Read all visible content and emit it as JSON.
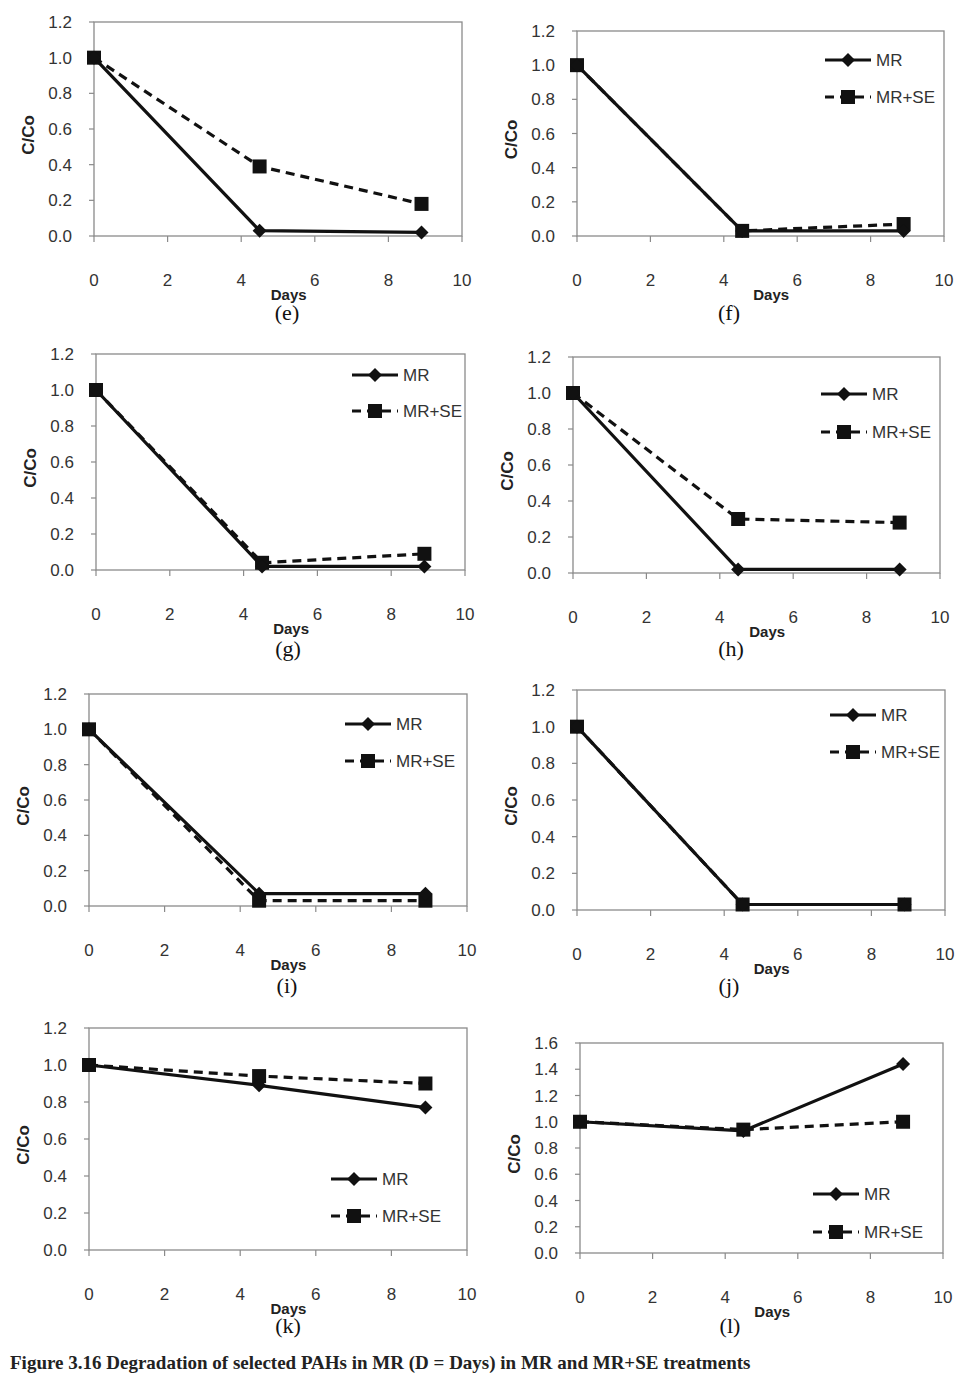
{
  "figure": {
    "caption": "Figure 3.16 Degradation of selected PAHs in MR (D = Days) in MR and MR+SE treatments",
    "caption_clipped": true
  },
  "style": {
    "line_color": "#111111",
    "axis_color": "#8a8a8a",
    "tick_label_color": "#333333"
  },
  "chart_data": [
    {
      "id": "e",
      "panel_label": "(e)",
      "type": "line",
      "title": "",
      "xlabel": "Days",
      "ylabel": "C/Co",
      "xlim": [
        0,
        10
      ],
      "ylim": [
        0,
        1.2
      ],
      "xticks": [
        0,
        2,
        4,
        6,
        8,
        10
      ],
      "yticks": [
        "0.0",
        "0.2",
        "0.4",
        "0.6",
        "0.8",
        "1.0",
        "1.2"
      ],
      "grid": false,
      "legend": null,
      "x": [
        0,
        4.5,
        8.9
      ],
      "series": [
        {
          "name": "MR",
          "style": "solid",
          "marker": "diamond",
          "values": [
            1.0,
            0.03,
            0.02
          ]
        },
        {
          "name": "MR+SE",
          "style": "dashed",
          "marker": "square",
          "values": [
            1.0,
            0.39,
            0.18
          ]
        }
      ],
      "box": {
        "left": 94,
        "right": 462,
        "top": 22,
        "bottom": 236
      },
      "label_pos": {
        "x": 287,
        "y": 312
      }
    },
    {
      "id": "f",
      "panel_label": "(f)",
      "type": "line",
      "title": "",
      "xlabel": "Days",
      "ylabel": "C/Co",
      "xlim": [
        0,
        10
      ],
      "ylim": [
        0,
        1.2
      ],
      "xticks": [
        0,
        2,
        4,
        6,
        8,
        10
      ],
      "yticks": [
        "0.0",
        "0.2",
        "0.4",
        "0.6",
        "0.8",
        "1.0",
        "1.2"
      ],
      "grid": false,
      "legend": {
        "position": "top-right",
        "entries": [
          "MR",
          "MR+SE"
        ]
      },
      "x": [
        0,
        4.5,
        8.9
      ],
      "series": [
        {
          "name": "MR",
          "style": "solid",
          "marker": "diamond",
          "values": [
            1.0,
            0.03,
            0.03
          ]
        },
        {
          "name": "MR+SE",
          "style": "dashed",
          "marker": "square",
          "values": [
            1.0,
            0.03,
            0.07
          ]
        }
      ],
      "box": {
        "left": 577,
        "right": 944,
        "top": 31,
        "bottom": 236
      },
      "legend_box": {
        "x": 825,
        "y1": 60,
        "y2": 97
      },
      "label_pos": {
        "x": 729,
        "y": 312
      }
    },
    {
      "id": "g",
      "panel_label": "(g)",
      "type": "line",
      "title": "",
      "xlabel": "Days",
      "ylabel": "C/Co",
      "xlim": [
        0,
        10
      ],
      "ylim": [
        0,
        1.2
      ],
      "xticks": [
        0,
        2,
        4,
        6,
        8,
        10
      ],
      "yticks": [
        "0.0",
        "0.2",
        "0.4",
        "0.6",
        "0.8",
        "1.0",
        "1.2"
      ],
      "grid": false,
      "legend": {
        "position": "top-right",
        "entries": [
          "MR",
          "MR+SE"
        ]
      },
      "x": [
        0,
        4.5,
        8.9
      ],
      "series": [
        {
          "name": "MR",
          "style": "solid",
          "marker": "diamond",
          "values": [
            1.0,
            0.02,
            0.02
          ]
        },
        {
          "name": "MR+SE",
          "style": "dashed",
          "marker": "square",
          "values": [
            1.0,
            0.04,
            0.09
          ]
        }
      ],
      "box": {
        "left": 96,
        "right": 465,
        "top": 354,
        "bottom": 570
      },
      "legend_box": {
        "x": 352,
        "y1": 375,
        "y2": 411
      },
      "label_pos": {
        "x": 288,
        "y": 648
      }
    },
    {
      "id": "h",
      "panel_label": "(h)",
      "type": "line",
      "title": "",
      "xlabel": "Days",
      "ylabel": "C/Co",
      "xlim": [
        0,
        10
      ],
      "ylim": [
        0,
        1.2
      ],
      "xticks": [
        0,
        2,
        4,
        6,
        8,
        10
      ],
      "yticks": [
        "0.0",
        "0.2",
        "0.4",
        "0.6",
        "0.8",
        "1.0",
        "1.2"
      ],
      "grid": false,
      "legend": {
        "position": "top-right",
        "entries": [
          "MR",
          "MR+SE"
        ]
      },
      "x": [
        0,
        4.5,
        8.9
      ],
      "series": [
        {
          "name": "MR",
          "style": "solid",
          "marker": "diamond",
          "values": [
            1.0,
            0.02,
            0.02
          ]
        },
        {
          "name": "MR+SE",
          "style": "dashed",
          "marker": "square",
          "values": [
            1.0,
            0.3,
            0.28
          ]
        }
      ],
      "box": {
        "left": 573,
        "right": 940,
        "top": 357,
        "bottom": 573
      },
      "legend_box": {
        "x": 821,
        "y1": 394,
        "y2": 432
      },
      "label_pos": {
        "x": 731,
        "y": 648
      }
    },
    {
      "id": "i",
      "panel_label": "(i)",
      "type": "line",
      "title": "",
      "xlabel": "Days",
      "ylabel": "C/Co",
      "xlim": [
        0,
        10
      ],
      "ylim": [
        0,
        1.2
      ],
      "xticks": [
        0,
        2,
        4,
        6,
        8,
        10
      ],
      "yticks": [
        "0.0",
        "0.2",
        "0.4",
        "0.6",
        "0.8",
        "1.0",
        "1.2"
      ],
      "grid": false,
      "legend": {
        "position": "top-right",
        "entries": [
          "MR",
          "MR+SE"
        ]
      },
      "x": [
        0,
        4.5,
        8.9
      ],
      "series": [
        {
          "name": "MR",
          "style": "solid",
          "marker": "diamond",
          "values": [
            1.0,
            0.07,
            0.07
          ]
        },
        {
          "name": "MR+SE",
          "style": "dashed",
          "marker": "square",
          "values": [
            1.0,
            0.03,
            0.03
          ]
        }
      ],
      "box": {
        "left": 89,
        "right": 467,
        "top": 694,
        "bottom": 906
      },
      "legend_box": {
        "x": 345,
        "y1": 724,
        "y2": 761
      },
      "label_pos": {
        "x": 287,
        "y": 985
      }
    },
    {
      "id": "j",
      "panel_label": "(j)",
      "type": "line",
      "title": "",
      "xlabel": "Days",
      "ylabel": "C/Co",
      "xlim": [
        0,
        10
      ],
      "ylim": [
        0,
        1.2
      ],
      "xticks": [
        0,
        2,
        4,
        6,
        8,
        10
      ],
      "yticks": [
        "0.0",
        "0.2",
        "0.4",
        "0.6",
        "0.8",
        "1.0",
        "1.2"
      ],
      "grid": false,
      "legend": {
        "position": "top-right",
        "entries": [
          "MR",
          "MR+SE"
        ]
      },
      "x": [
        0,
        4.5,
        8.9
      ],
      "series": [
        {
          "name": "MR",
          "style": "solid",
          "marker": "diamond",
          "values": [
            1.0,
            0.03,
            0.03
          ]
        },
        {
          "name": "MR+SE",
          "style": "dashed",
          "marker": "square",
          "values": [
            1.0,
            0.03,
            0.03
          ]
        }
      ],
      "box": {
        "left": 577,
        "right": 945,
        "top": 690,
        "bottom": 910
      },
      "legend_box": {
        "x": 830,
        "y1": 715,
        "y2": 752
      },
      "label_pos": {
        "x": 729,
        "y": 985
      }
    },
    {
      "id": "k",
      "panel_label": "(k)",
      "type": "line",
      "title": "",
      "xlabel": "Days",
      "ylabel": "C/Co",
      "xlim": [
        0,
        10
      ],
      "ylim": [
        0,
        1.2
      ],
      "xticks": [
        0,
        2,
        4,
        6,
        8,
        10
      ],
      "yticks": [
        "0.0",
        "0.2",
        "0.4",
        "0.6",
        "0.8",
        "1.0",
        "1.2"
      ],
      "grid": false,
      "legend": {
        "position": "bottom-right",
        "entries": [
          "MR",
          "MR+SE"
        ]
      },
      "x": [
        0,
        4.5,
        8.9
      ],
      "series": [
        {
          "name": "MR",
          "style": "solid",
          "marker": "diamond",
          "values": [
            1.0,
            0.89,
            0.77
          ]
        },
        {
          "name": "MR+SE",
          "style": "dashed",
          "marker": "square",
          "values": [
            1.0,
            0.94,
            0.9
          ]
        }
      ],
      "box": {
        "left": 89,
        "right": 467,
        "top": 1028,
        "bottom": 1250
      },
      "legend_box": {
        "x": 331,
        "y1": 1179,
        "y2": 1216
      },
      "label_pos": {
        "x": 288,
        "y": 1325
      }
    },
    {
      "id": "l",
      "panel_label": "(l)",
      "type": "line",
      "title": "",
      "xlabel": "Days",
      "ylabel": "C/Co",
      "xlim": [
        0,
        10
      ],
      "ylim": [
        0,
        1.6
      ],
      "xticks": [
        0,
        2,
        4,
        6,
        8,
        10
      ],
      "yticks": [
        "0.0",
        "0.2",
        "0.4",
        "0.6",
        "0.8",
        "1.0",
        "1.2",
        "1.4",
        "1.6"
      ],
      "grid": false,
      "legend": {
        "position": "bottom-right",
        "entries": [
          "MR",
          "MR+SE"
        ]
      },
      "x": [
        0,
        4.5,
        8.9
      ],
      "series": [
        {
          "name": "MR",
          "style": "solid",
          "marker": "diamond",
          "values": [
            1.0,
            0.93,
            1.44
          ]
        },
        {
          "name": "MR+SE",
          "style": "dashed",
          "marker": "square",
          "values": [
            1.0,
            0.94,
            1.0
          ]
        }
      ],
      "box": {
        "left": 580,
        "right": 943,
        "top": 1043,
        "bottom": 1253
      },
      "legend_box": {
        "x": 813,
        "y1": 1194,
        "y2": 1232
      },
      "label_pos": {
        "x": 730,
        "y": 1325
      }
    }
  ]
}
